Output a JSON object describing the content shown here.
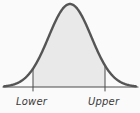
{
  "figure": {
    "name": "normal-distribution-interval-diagram",
    "background_color": "#fafafa",
    "width": 140,
    "height": 113
  },
  "chart_data": {
    "type": "area",
    "title": "",
    "subtitle": "",
    "xlabel": "",
    "ylabel": "",
    "grid": false,
    "legend_position": "none",
    "curve": {
      "name": "normal-density-curve",
      "distribution": "normal",
      "mean": 0,
      "sd": 1,
      "peak_x_px": 70,
      "peak_y_px": 4,
      "baseline_y_px": 87,
      "left_tail_x_px": 4,
      "right_tail_x_px": 136,
      "stroke_color": "#555555",
      "stroke_width": 2.4
    },
    "shaded_region": {
      "name": "interval-shaded-area",
      "fill_color": "#e9e9e9",
      "from_x_px": 33,
      "to_x_px": 105
    },
    "boundaries": [
      {
        "id": "lower",
        "label": "Lower",
        "x_px": 33,
        "top_y_px": 70,
        "bottom_y_px": 87,
        "line_color": "#4a4a4a",
        "label_x_px": 16,
        "label_y_px": 105
      },
      {
        "id": "upper",
        "label": "Upper",
        "x_px": 105,
        "top_y_px": 66,
        "bottom_y_px": 87,
        "line_color": "#4a4a4a",
        "label_x_px": 88,
        "label_y_px": 105
      }
    ],
    "axis": {
      "name": "horizontal-axis",
      "y_px": 87,
      "x_start_px": 3,
      "x_end_px": 138,
      "color": "#4a4a4a",
      "stroke_width": 1.1
    }
  }
}
